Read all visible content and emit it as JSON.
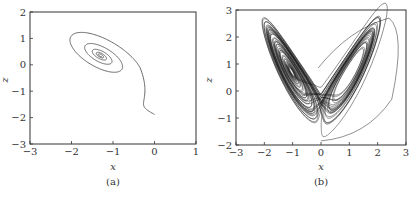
{
  "chart_data": [
    {
      "type": "line",
      "panel_label": "(a)",
      "title": "",
      "xlabel": "x",
      "ylabel": "z",
      "xlim": [
        -3,
        1
      ],
      "ylim": [
        -3,
        2
      ],
      "xticks": [
        -3,
        -2,
        -1,
        0,
        1
      ],
      "yticks": [
        -3,
        -2,
        -1,
        0,
        1,
        2
      ],
      "xtick_labels": [
        "−3",
        "−2",
        "−1",
        "0",
        "1"
      ],
      "ytick_labels": [
        "−3",
        "−2",
        "−1",
        "0",
        "1",
        "2"
      ],
      "grid": false,
      "description": "Trajectory starting near (0, -1.9) spiralling inward to a stable focus near (-1.3, 0.35)",
      "series": [
        {
          "name": "trajectory",
          "start": [
            0.0,
            -1.88
          ],
          "focus": [
            -1.3,
            0.35
          ],
          "approx_points": [
            [
              0.0,
              -1.88
            ],
            [
              -0.5,
              -1.7
            ],
            [
              -1.2,
              -1.1
            ],
            [
              -1.85,
              -0.2
            ],
            [
              -2.1,
              0.9
            ],
            [
              -1.9,
              1.35
            ],
            [
              -1.4,
              1.1
            ],
            [
              -0.9,
              0.5
            ],
            [
              -0.7,
              -0.3
            ],
            [
              -0.9,
              -0.75
            ],
            [
              -1.4,
              -0.4
            ],
            [
              -1.75,
              0.3
            ],
            [
              -1.55,
              0.8
            ],
            [
              -1.1,
              0.55
            ],
            [
              -1.0,
              0.1
            ],
            [
              -1.3,
              0.0
            ],
            [
              -1.5,
              0.5
            ],
            [
              -1.3,
              0.35
            ]
          ]
        }
      ]
    },
    {
      "type": "line",
      "panel_label": "(b)",
      "title": "",
      "xlabel": "x",
      "ylabel": "z",
      "xlim": [
        -3,
        3
      ],
      "ylim": [
        -2,
        3
      ],
      "xticks": [
        -3,
        -2,
        -1,
        0,
        1,
        2,
        3
      ],
      "yticks": [
        -2,
        -1,
        0,
        1,
        2,
        3
      ],
      "xtick_labels": [
        "−3",
        "−2",
        "−1",
        "0",
        "1",
        "2",
        "3"
      ],
      "ytick_labels": [
        "−2",
        "−1",
        "0",
        "1",
        "2",
        "3"
      ],
      "grid": false,
      "description": "Chaotic butterfly-shaped (Lorenz-like) attractor with two lobes centred near (-1.1, 0.5) and (1.1, 0.5); x range approx [-2.3, 2.7], z range approx [-1.85, 2.7]",
      "series": [
        {
          "name": "trajectory",
          "start": [
            0.0,
            -1.85
          ],
          "lobe_centers": [
            [
              -1.1,
              0.5
            ],
            [
              1.1,
              0.5
            ]
          ],
          "extent": {
            "x": [
              -2.3,
              2.7
            ],
            "z": [
              -1.85,
              2.7
            ]
          }
        }
      ]
    }
  ]
}
